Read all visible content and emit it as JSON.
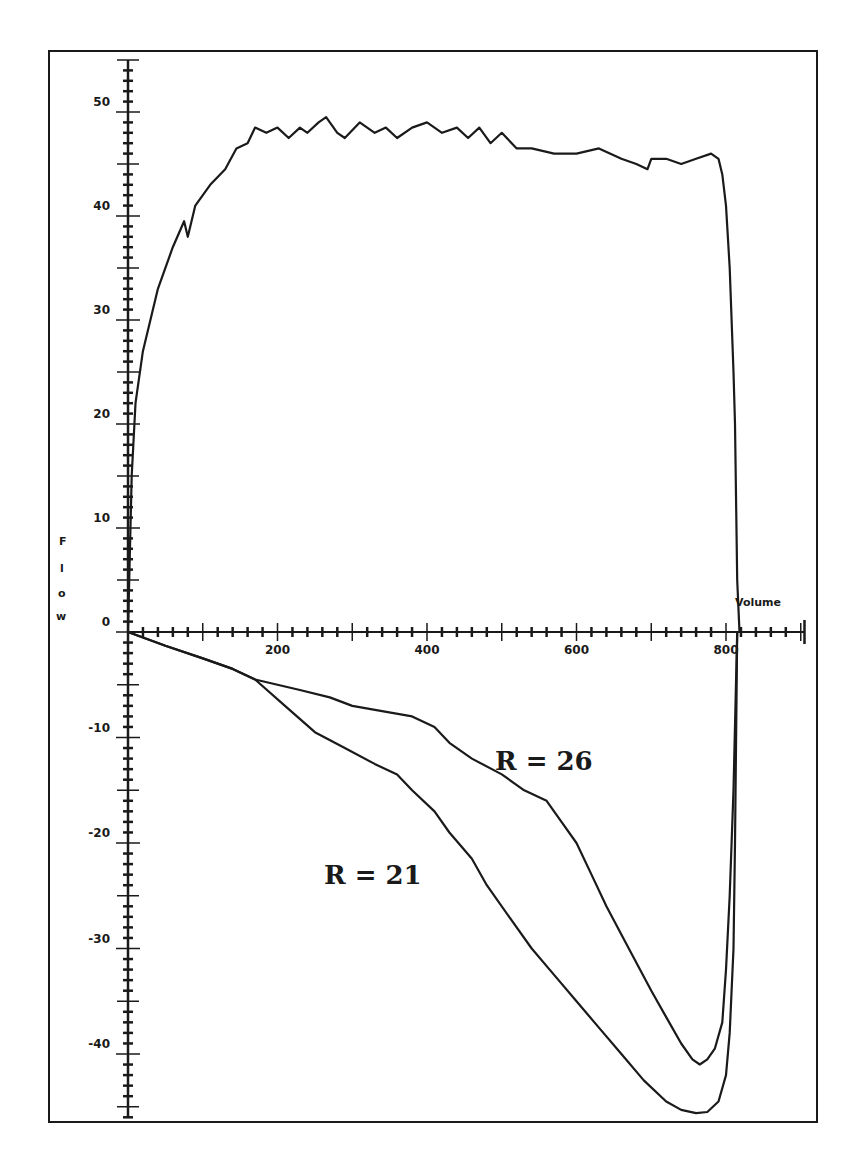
{
  "chart_data": {
    "type": "line",
    "title": "",
    "xlabel": "Volume",
    "ylabel": "Flow",
    "xlim": [
      0,
      905
    ],
    "ylim": [
      -46,
      55
    ],
    "grid": false,
    "x_ticks": {
      "major_step": 100,
      "minor_step": 20,
      "labels": [
        "200",
        "400",
        "600",
        "800"
      ],
      "label_values": [
        200,
        400,
        600,
        800
      ]
    },
    "y_ticks": {
      "medium_step": 5,
      "minor_step": 1,
      "labels": [
        "50",
        "40",
        "30",
        "20",
        "10",
        "0",
        "-10",
        "-20",
        "-30",
        "-40"
      ],
      "label_values": [
        50,
        40,
        30,
        20,
        10,
        0,
        -10,
        -20,
        -30,
        -40
      ]
    },
    "series": [
      {
        "name": "Expiratory flow",
        "x": [
          0,
          5,
          10,
          20,
          40,
          60,
          75,
          80,
          90,
          110,
          130,
          145,
          160,
          170,
          185,
          200,
          215,
          230,
          240,
          255,
          265,
          280,
          290,
          310,
          330,
          345,
          360,
          380,
          400,
          420,
          440,
          455,
          470,
          485,
          500,
          520,
          540,
          570,
          600,
          630,
          660,
          680,
          695,
          700,
          720,
          740,
          760,
          780,
          790,
          795,
          800,
          805,
          810,
          812,
          815,
          818
        ],
        "y": [
          0,
          15,
          22,
          27,
          33,
          37,
          39.5,
          38,
          41,
          43,
          44.5,
          46.5,
          47,
          48.5,
          48,
          48.5,
          47.5,
          48.5,
          48,
          49,
          49.5,
          48,
          47.5,
          49,
          48,
          48.5,
          47.5,
          48.5,
          49,
          48,
          48.5,
          47.5,
          48.5,
          47,
          48,
          46.5,
          46.5,
          46,
          46,
          46.5,
          45.5,
          45,
          44.5,
          45.5,
          45.5,
          45,
          45.5,
          46,
          45.5,
          44,
          41,
          35,
          25,
          20,
          5,
          0
        ]
      },
      {
        "name": "R = 26",
        "x": [
          0,
          50,
          100,
          140,
          170,
          200,
          230,
          270,
          300,
          340,
          380,
          410,
          430,
          460,
          500,
          530,
          560,
          580,
          600,
          620,
          640,
          670,
          700,
          720,
          740,
          755,
          765,
          775,
          785,
          795,
          800,
          805,
          810,
          815
        ],
        "y": [
          0,
          -1.3,
          -2.5,
          -3.5,
          -4.5,
          -5,
          -5.5,
          -6.2,
          -7,
          -7.5,
          -8,
          -9,
          -10.5,
          -12,
          -13.5,
          -15,
          -16,
          -18,
          -20,
          -23,
          -26,
          -30,
          -34,
          -36.5,
          -39,
          -40.5,
          -41,
          -40.5,
          -39.5,
          -37,
          -32,
          -25,
          -15,
          0
        ]
      },
      {
        "name": "R = 21",
        "x": [
          0,
          50,
          100,
          140,
          170,
          210,
          250,
          290,
          330,
          360,
          380,
          410,
          430,
          460,
          480,
          510,
          540,
          570,
          600,
          630,
          660,
          690,
          720,
          740,
          760,
          775,
          790,
          800,
          805,
          810,
          812,
          815
        ],
        "y": [
          0,
          -1.3,
          -2.5,
          -3.5,
          -4.5,
          -7,
          -9.5,
          -11,
          -12.5,
          -13.5,
          -15,
          -17,
          -19,
          -21.5,
          -24,
          -27,
          -30,
          -32.5,
          -35,
          -37.5,
          -40,
          -42.5,
          -44.5,
          -45.3,
          -45.6,
          -45.5,
          -44.5,
          -42,
          -38,
          -30,
          -20,
          0
        ]
      }
    ],
    "annotations": [
      {
        "text": "R = 26",
        "x": 480,
        "y": -13
      },
      {
        "text": "R = 21",
        "x": 260,
        "y": -24
      }
    ]
  },
  "labels": {
    "x_axis_title": "Volume",
    "y_axis_title_letters": [
      "F",
      "l",
      "o",
      "w"
    ],
    "annotation_r26": "R = 26",
    "annotation_r21": "R = 21"
  },
  "style": {
    "ink": "#1a1a1a",
    "background": "#ffffff"
  }
}
